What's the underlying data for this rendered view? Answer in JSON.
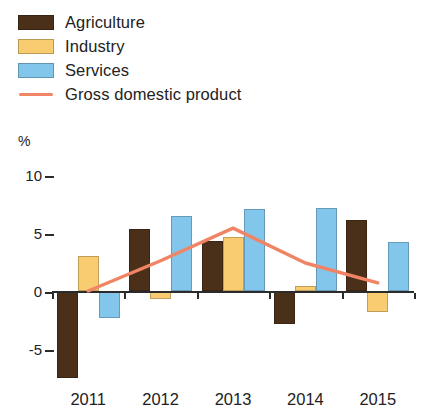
{
  "chart_data": {
    "type": "bar",
    "title": "",
    "subtitle": "",
    "xlabel": "",
    "ylabel": "%",
    "unit_label": "%",
    "categories": [
      "2011",
      "2012",
      "2013",
      "2014",
      "2015"
    ],
    "ylim": [
      -7.5,
      10
    ],
    "yticks": [
      10,
      5,
      0,
      -5
    ],
    "ytick_labels": [
      "10",
      "5",
      "0",
      "-5"
    ],
    "grid": false,
    "legend_position": "top-left",
    "series": [
      {
        "name": "Agriculture",
        "type": "bar",
        "color": "#4a3018",
        "values": [
          -7.5,
          5.3,
          4.3,
          -2.8,
          6.1
        ]
      },
      {
        "name": "Industry",
        "type": "bar",
        "color": "#f9cc72",
        "values": [
          3.0,
          -0.7,
          4.6,
          0.4,
          -1.8
        ]
      },
      {
        "name": "Services",
        "type": "bar",
        "color": "#83c6ec",
        "values": [
          -2.3,
          6.4,
          7.0,
          7.1,
          4.2
        ]
      },
      {
        "name": "Gross domestic product",
        "type": "line",
        "color": "#f08565",
        "values": [
          0.0,
          2.6,
          5.4,
          2.4,
          0.7
        ]
      }
    ]
  },
  "legend": {
    "items": [
      {
        "label": "Agriculture",
        "color": "#4a3018",
        "marker": "swatch"
      },
      {
        "label": "Industry",
        "color": "#f9cc72",
        "marker": "swatch"
      },
      {
        "label": "Services",
        "color": "#83c6ec",
        "marker": "swatch"
      },
      {
        "label": "Gross domestic product",
        "color": "#f08565",
        "marker": "line"
      }
    ]
  },
  "axis": {
    "unit": "%",
    "y_labels": [
      "10",
      "5",
      "0",
      "-5"
    ],
    "x_labels": [
      "2011",
      "2012",
      "2013",
      "2014",
      "2015"
    ]
  }
}
